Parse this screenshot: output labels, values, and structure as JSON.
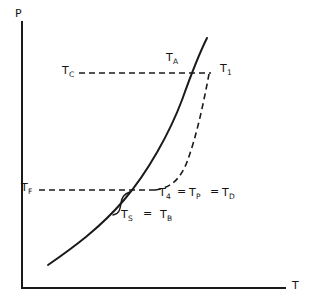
{
  "figure": {
    "type": "phase-diagram",
    "background_color": "#ffffff",
    "stroke_color": "#1a1a1a",
    "axes": {
      "y_label": "P",
      "x_label": "T",
      "y_axis": {
        "x": 22,
        "y_top": 22,
        "y_bottom": 288
      },
      "x_axis": {
        "y": 288,
        "x_left": 22,
        "x_right": 285
      }
    },
    "labels": [
      {
        "name": "label-tc",
        "base": "T",
        "sub": "C",
        "x": 62,
        "y": 65
      },
      {
        "name": "label-ta",
        "base": "T",
        "sub": "A",
        "x": 166,
        "y": 52
      },
      {
        "name": "label-t1",
        "base": "T",
        "sub": "1",
        "x": 220,
        "y": 63
      },
      {
        "name": "label-tf",
        "base": "T",
        "sub": "F",
        "x": 21,
        "y": 182
      },
      {
        "name": "label-ts",
        "base": "T",
        "sub": "S",
        "x": 121,
        "y": 209
      },
      {
        "name": "label-tb",
        "base": "T",
        "sub": "B",
        "x": 160,
        "y": 209
      },
      {
        "name": "label-t4",
        "base": "T",
        "sub": "4",
        "x": 159,
        "y": 187
      },
      {
        "name": "label-tp",
        "base": "T",
        "sub": "P",
        "x": 189,
        "y": 187
      },
      {
        "name": "label-td",
        "base": "T",
        "sub": "D",
        "x": 222,
        "y": 187
      }
    ],
    "equals_signs": [
      {
        "name": "equals-t4-tp",
        "text": "=",
        "x": 177,
        "y": 186
      },
      {
        "name": "equals-tp-td",
        "text": "=",
        "x": 210,
        "y": 186
      },
      {
        "name": "equals-ts-tb",
        "text": "=",
        "x": 143,
        "y": 208
      }
    ],
    "curves": {
      "solid_curve": {
        "name": "solid-equilibrium-curve",
        "path": "M 48 265 C 74 247, 100 228, 124 200 C 148 172, 170 132, 182 100 C 192 72, 200 52, 207 38",
        "dashed": false
      },
      "dashed_curve": {
        "name": "dashed-metastable-curve",
        "path": "M 155 190 C 170 188, 180 180, 187 162 C 196 138, 203 106, 209 74",
        "dashed": true
      },
      "upper_dashed_line": {
        "name": "upper-isobar-dashed-line",
        "x1": 79,
        "y1": 73,
        "x2": 211,
        "y2": 73,
        "dashed": true
      },
      "lower_dashed_line": {
        "name": "lower-isobar-dashed-line",
        "x1": 39,
        "y1": 190,
        "x2": 156,
        "y2": 190,
        "dashed": true
      },
      "brace": {
        "name": "gap-brace-marker",
        "path": "M 113 215 C 119 214, 120 210, 121 203 C 122 197, 124 194, 130 192",
        "dashed": false
      }
    }
  }
}
